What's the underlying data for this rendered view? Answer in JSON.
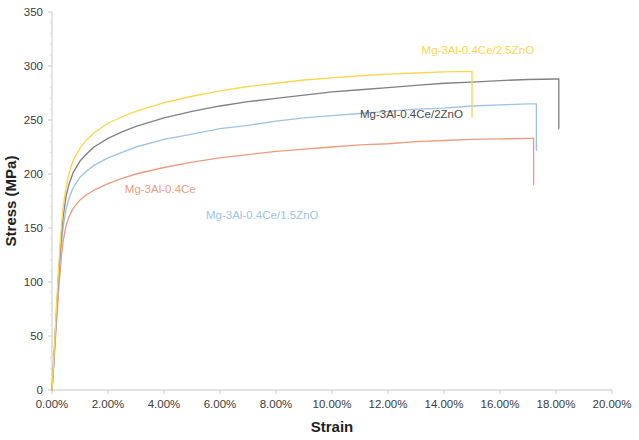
{
  "chart_data": {
    "type": "line",
    "title": "",
    "xlabel": "Strain",
    "ylabel": "Stress (MPa)",
    "xlim": [
      0,
      20
    ],
    "ylim": [
      0,
      350
    ],
    "grid": false,
    "legend_position": "inline-annotations",
    "x_tick_labels": [
      "0.00%",
      "2.00%",
      "4.00%",
      "6.00%",
      "8.00%",
      "10.00%",
      "12.00%",
      "14.00%",
      "16.00%",
      "18.00%",
      "20.00%"
    ],
    "x_tick_values": [
      0,
      2,
      4,
      6,
      8,
      10,
      12,
      14,
      16,
      18,
      20
    ],
    "y_tick_labels": [
      "0",
      "50",
      "100",
      "150",
      "200",
      "250",
      "300",
      "350"
    ],
    "y_tick_values": [
      0,
      50,
      100,
      150,
      200,
      250,
      300,
      350
    ],
    "series": [
      {
        "name": "Mg-3Al-0.4Ce",
        "color": "#ED9B7C",
        "label_x": 2.6,
        "label_y": 182,
        "fracture_strain": 17.2,
        "fracture_stress": 233,
        "drop_to_stress": 190,
        "points": [
          [
            0.0,
            0
          ],
          [
            0.05,
            18
          ],
          [
            0.1,
            38
          ],
          [
            0.15,
            58
          ],
          [
            0.2,
            78
          ],
          [
            0.25,
            97
          ],
          [
            0.3,
            113
          ],
          [
            0.35,
            127
          ],
          [
            0.4,
            138
          ],
          [
            0.5,
            152
          ],
          [
            0.6,
            160
          ],
          [
            0.75,
            168
          ],
          [
            1.0,
            176
          ],
          [
            1.25,
            181
          ],
          [
            1.5,
            185
          ],
          [
            2.0,
            191
          ],
          [
            2.5,
            196
          ],
          [
            3.0,
            200
          ],
          [
            4.0,
            206
          ],
          [
            5.0,
            211
          ],
          [
            6.0,
            215
          ],
          [
            7.0,
            218
          ],
          [
            8.0,
            221
          ],
          [
            9.0,
            223
          ],
          [
            10.0,
            225
          ],
          [
            11.0,
            227
          ],
          [
            12.0,
            228
          ],
          [
            13.0,
            230
          ],
          [
            14.0,
            231
          ],
          [
            15.0,
            232
          ],
          [
            16.0,
            232.5
          ],
          [
            17.0,
            233
          ],
          [
            17.2,
            233
          ]
        ]
      },
      {
        "name": "Mg-3Al-0.4Ce/1.5ZnO",
        "color": "#9DC3E6",
        "label_x": 5.5,
        "label_y": 158,
        "fracture_strain": 17.3,
        "fracture_stress": 265,
        "drop_to_stress": 222,
        "points": [
          [
            0.0,
            0
          ],
          [
            0.05,
            20
          ],
          [
            0.1,
            42
          ],
          [
            0.15,
            64
          ],
          [
            0.2,
            86
          ],
          [
            0.25,
            106
          ],
          [
            0.3,
            124
          ],
          [
            0.35,
            139
          ],
          [
            0.4,
            151
          ],
          [
            0.5,
            167
          ],
          [
            0.6,
            177
          ],
          [
            0.75,
            187
          ],
          [
            1.0,
            197
          ],
          [
            1.25,
            203
          ],
          [
            1.5,
            208
          ],
          [
            2.0,
            215
          ],
          [
            2.5,
            220
          ],
          [
            3.0,
            225
          ],
          [
            4.0,
            232
          ],
          [
            5.0,
            237
          ],
          [
            6.0,
            242
          ],
          [
            7.0,
            245
          ],
          [
            8.0,
            249
          ],
          [
            9.0,
            252
          ],
          [
            10.0,
            254
          ],
          [
            11.0,
            256
          ],
          [
            12.0,
            258
          ],
          [
            13.0,
            260
          ],
          [
            14.0,
            261
          ],
          [
            15.0,
            263
          ],
          [
            16.0,
            264
          ],
          [
            17.0,
            265
          ],
          [
            17.3,
            265
          ]
        ]
      },
      {
        "name": "Mg-3Al-0.4Ce/2ZnO",
        "color": "#808080",
        "label_x": 11.0,
        "label_y": 252,
        "fracture_strain": 18.1,
        "fracture_stress": 288,
        "drop_to_stress": 242,
        "points": [
          [
            0.0,
            0
          ],
          [
            0.05,
            21
          ],
          [
            0.1,
            45
          ],
          [
            0.15,
            68
          ],
          [
            0.2,
            91
          ],
          [
            0.25,
            113
          ],
          [
            0.3,
            132
          ],
          [
            0.35,
            148
          ],
          [
            0.4,
            161
          ],
          [
            0.5,
            179
          ],
          [
            0.6,
            190
          ],
          [
            0.75,
            201
          ],
          [
            1.0,
            212
          ],
          [
            1.25,
            219
          ],
          [
            1.5,
            225
          ],
          [
            2.0,
            233
          ],
          [
            2.5,
            239
          ],
          [
            3.0,
            244
          ],
          [
            4.0,
            252
          ],
          [
            5.0,
            258
          ],
          [
            6.0,
            263
          ],
          [
            7.0,
            267
          ],
          [
            8.0,
            270
          ],
          [
            9.0,
            273
          ],
          [
            10.0,
            276
          ],
          [
            11.0,
            278
          ],
          [
            12.0,
            280
          ],
          [
            13.0,
            282
          ],
          [
            14.0,
            284
          ],
          [
            15.0,
            285
          ],
          [
            16.0,
            286.5
          ],
          [
            17.0,
            287.5
          ],
          [
            18.0,
            288
          ],
          [
            18.1,
            288
          ]
        ]
      },
      {
        "name": "Mg-3Al-0.4Ce/2.5ZnO",
        "color": "#FFD54F",
        "label_x": 13.2,
        "label_y": 311,
        "fracture_strain": 15.0,
        "fracture_stress": 295,
        "drop_to_stress": 253,
        "points": [
          [
            0.0,
            0
          ],
          [
            0.05,
            22
          ],
          [
            0.1,
            47
          ],
          [
            0.15,
            72
          ],
          [
            0.2,
            96
          ],
          [
            0.25,
            119
          ],
          [
            0.3,
            139
          ],
          [
            0.35,
            156
          ],
          [
            0.4,
            170
          ],
          [
            0.5,
            188
          ],
          [
            0.6,
            200
          ],
          [
            0.75,
            212
          ],
          [
            1.0,
            224
          ],
          [
            1.25,
            232
          ],
          [
            1.5,
            238
          ],
          [
            2.0,
            247
          ],
          [
            2.5,
            253
          ],
          [
            3.0,
            258
          ],
          [
            4.0,
            266
          ],
          [
            5.0,
            272
          ],
          [
            6.0,
            277
          ],
          [
            7.0,
            281
          ],
          [
            8.0,
            284
          ],
          [
            9.0,
            287
          ],
          [
            10.0,
            289
          ],
          [
            11.0,
            291
          ],
          [
            12.0,
            292.5
          ],
          [
            13.0,
            293.5
          ],
          [
            14.0,
            294.5
          ],
          [
            15.0,
            295
          ]
        ]
      }
    ]
  }
}
